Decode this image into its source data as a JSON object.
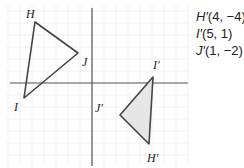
{
  "figure": {
    "origin_px": [
      92,
      83
    ],
    "unit_px": 12,
    "grid_color": "#eeeeee",
    "axis_color": "#555555",
    "stroke_color": "#444444",
    "image_fill": "#e6e6e6"
  },
  "preimage": {
    "label": "Triangle HIJ",
    "vertices": [
      {
        "name": "H",
        "label": "H",
        "px": [
          35,
          22
        ],
        "label_px": [
          26,
          18
        ]
      },
      {
        "name": "I",
        "label": "I",
        "px": [
          24,
          98
        ],
        "label_px": [
          14,
          111
        ]
      },
      {
        "name": "J",
        "label": "J",
        "px": [
          78,
          53
        ],
        "label_px": [
          82,
          66
        ]
      }
    ]
  },
  "image": {
    "label": "Triangle H'I'J'",
    "vertices": [
      {
        "name": "H'",
        "label": "H′",
        "px": [
          149,
          144
        ],
        "label_px": [
          147,
          162
        ]
      },
      {
        "name": "I'",
        "label": "I′",
        "px": [
          153,
          77
        ],
        "label_px": [
          153,
          69
        ]
      },
      {
        "name": "J'",
        "label": "J′",
        "px": [
          120,
          115
        ],
        "label_px": [
          95,
          112
        ]
      }
    ]
  },
  "coordinates_list": [
    {
      "var": "H′",
      "value": "(4, −4)"
    },
    {
      "var": "I′",
      "value": "(5, 1)"
    },
    {
      "var": "J′",
      "value": "(1, −2)"
    }
  ]
}
